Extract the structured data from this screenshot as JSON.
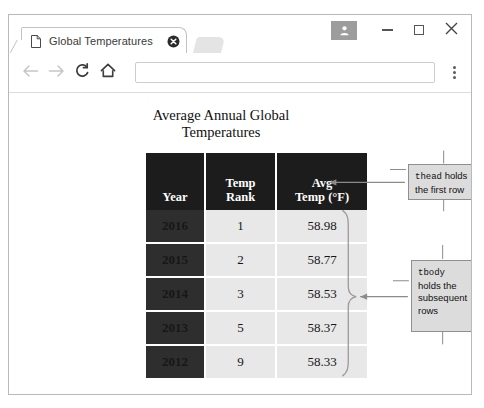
{
  "window": {
    "controls": {
      "profile_icon": "person-icon",
      "minimize_label": "—",
      "maximize_label": "□",
      "close_label": "✕"
    }
  },
  "tabstrip": {
    "tabs": [
      {
        "favicon": "page-icon",
        "title": "Global Temperatures",
        "close_icon": "close-circle-icon"
      }
    ]
  },
  "toolbar": {
    "back_icon": "arrow-left-icon",
    "forward_icon": "arrow-right-icon",
    "reload_icon": "reload-icon",
    "home_icon": "home-icon",
    "menu_icon": "kebab-menu-icon",
    "address": {
      "value": "",
      "placeholder": ""
    }
  },
  "page": {
    "title": "Average Annual Global Temperatures",
    "table": {
      "headers": [
        "Year",
        "Temp Rank",
        "Avg Temp (°F)"
      ],
      "header_lines": [
        [
          "Year"
        ],
        [
          "Temp",
          "Rank"
        ],
        [
          "Avg",
          "Temp (°F)"
        ]
      ],
      "rows": [
        {
          "year": "2016",
          "rank": "1",
          "avg": "58.98"
        },
        {
          "year": "2015",
          "rank": "2",
          "avg": "58.77"
        },
        {
          "year": "2014",
          "rank": "3",
          "avg": "58.53"
        },
        {
          "year": "2013",
          "rank": "5",
          "avg": "58.37"
        },
        {
          "year": "2012",
          "rank": "9",
          "avg": "58.33"
        }
      ]
    },
    "annotations": [
      {
        "id": "thead",
        "code": "thead",
        "text_line1": " holds",
        "text_line2": "the first row"
      },
      {
        "id": "tbody",
        "code": "tbody",
        "text_line1": "holds the",
        "text_line2": "subsequent",
        "text_line3": "rows"
      }
    ]
  },
  "colors": {
    "header_bg": "#1c1c1c",
    "year_bg": "#2e2e2e",
    "cell_bg": "#e8e8e8",
    "callout_bg": "#dcdcdc",
    "callout_border": "#8f8f8f",
    "frame_border": "#b9b9b9"
  }
}
